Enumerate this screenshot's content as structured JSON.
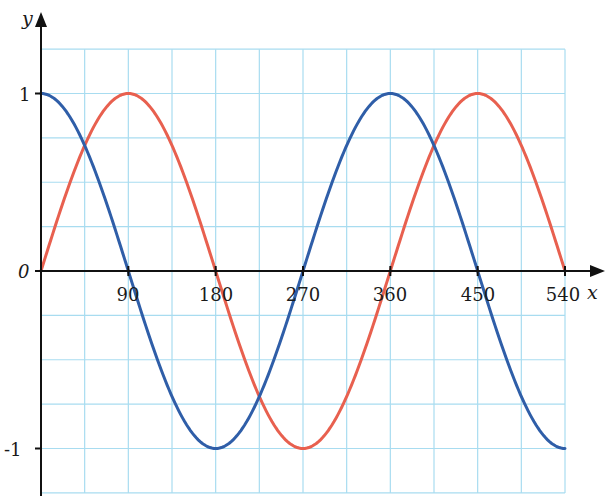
{
  "chart_data": {
    "type": "line",
    "title": "",
    "xlabel": "x",
    "ylabel": "y",
    "x_ticks": [
      "90",
      "180",
      "270",
      "360",
      "450",
      "540"
    ],
    "x_tick_values": [
      90,
      180,
      270,
      360,
      450,
      540
    ],
    "y_ticks": [
      "1",
      "0",
      "-1"
    ],
    "y_tick_values": [
      1,
      0,
      -1
    ],
    "xlim": [
      0,
      540
    ],
    "ylim": [
      -1.25,
      1.25
    ],
    "grid": true,
    "grid_x_step": 45,
    "grid_y_step": 0.25,
    "series": [
      {
        "name": "y = sin x",
        "color": "#e8604f",
        "function": "sin",
        "x": [
          0,
          45,
          90,
          135,
          180,
          225,
          270,
          315,
          360,
          405,
          450,
          495,
          540
        ],
        "values": [
          0,
          0.707,
          1,
          0.707,
          0,
          -0.707,
          -1,
          -0.707,
          0,
          0.707,
          1,
          0.707,
          0
        ]
      },
      {
        "name": "y = cos x",
        "color": "#2f5ea8",
        "function": "cos",
        "x": [
          0,
          45,
          90,
          135,
          180,
          225,
          270,
          315,
          360,
          405,
          450,
          495,
          540
        ],
        "values": [
          1,
          0.707,
          0,
          -0.707,
          -1,
          -0.707,
          0,
          0.707,
          1,
          0.707,
          0,
          -0.707,
          -1
        ]
      }
    ],
    "legend": "none"
  },
  "labels": {
    "x_axis": "x",
    "y_axis": "y",
    "origin": "0",
    "y_one": "1",
    "y_minus_one": "-1",
    "x90": "90",
    "x180": "180",
    "x270": "270",
    "x360": "360",
    "x450": "450",
    "x540": "540"
  },
  "colors": {
    "grid": "#a8dcf0",
    "axis": "#111111",
    "sin": "#e8604f",
    "cos": "#2f5ea8"
  }
}
